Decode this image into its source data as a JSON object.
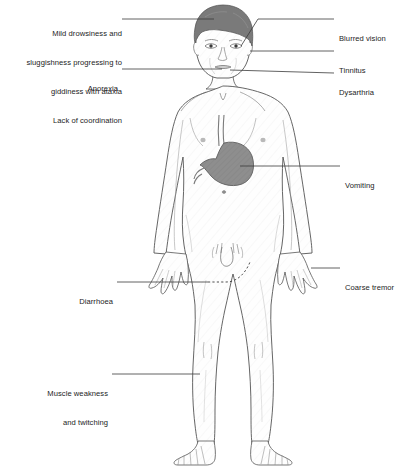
{
  "diagram": {
    "organ_highlight": "stomach",
    "colors": {
      "hair": "#7a7a7a",
      "stomach_fill": "#8e8e8e",
      "body_outline": "#4a4a4a",
      "body_fill": "#fdfdfd",
      "leader_line": "#3a3a3a",
      "text": "#1c1c1c",
      "background": "#ffffff"
    }
  },
  "labels": {
    "left": [
      {
        "id": "drowsiness",
        "lines": [
          "Mild drowsiness and",
          "sluggishness progressing to",
          "giddiness with ataxia",
          "Lack of coordination"
        ],
        "leader": "solid",
        "target": "head"
      },
      {
        "id": "anorexia",
        "lines": [
          "Anorexia"
        ],
        "leader": "solid",
        "target": "mouth-chin"
      },
      {
        "id": "diarrhoea",
        "lines": [
          "Diarrhoea"
        ],
        "leader": "dashed",
        "target": "lower-abdomen"
      },
      {
        "id": "muscle-weakness",
        "lines": [
          "Muscle weakness",
          "and twitching"
        ],
        "leader": "solid",
        "target": "right-calf"
      }
    ],
    "right": [
      {
        "id": "blurred-vision",
        "lines": [
          "Blurred vision"
        ],
        "leader": "solid",
        "target": "eye"
      },
      {
        "id": "tinnitus",
        "lines": [
          "Tinnitus"
        ],
        "leader": "solid",
        "target": "ear"
      },
      {
        "id": "dysarthria",
        "lines": [
          "Dysarthria"
        ],
        "leader": "solid",
        "target": "jaw-mouth"
      },
      {
        "id": "vomiting",
        "lines": [
          "Vomiting"
        ],
        "leader": "solid",
        "target": "stomach"
      },
      {
        "id": "coarse-tremor",
        "lines": [
          "Coarse tremor"
        ],
        "leader": "solid",
        "target": "left-hand"
      }
    ]
  }
}
